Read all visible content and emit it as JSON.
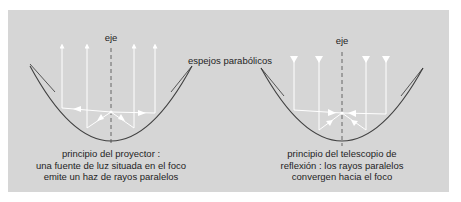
{
  "figure": {
    "colors": {
      "background": "#d6d6d6",
      "mirror": "#444444",
      "ray": "#ffffff",
      "axis": "#555555",
      "text": "#1e1e1e"
    },
    "shared_label": "espejos parabólicos",
    "left": {
      "axis_label": "eje",
      "caption_lines": [
        "principio del proyector :",
        "una fuente de luz situada en el foco",
        "emite un haz de rayos paralelos"
      ],
      "ray_direction": "outgoing-up"
    },
    "right": {
      "axis_label": "eje",
      "caption_lines": [
        "principio del telescopio de",
        "reflexión : los rayos paralelos",
        "convergen hacia el foco"
      ],
      "ray_direction": "incoming-down"
    }
  }
}
